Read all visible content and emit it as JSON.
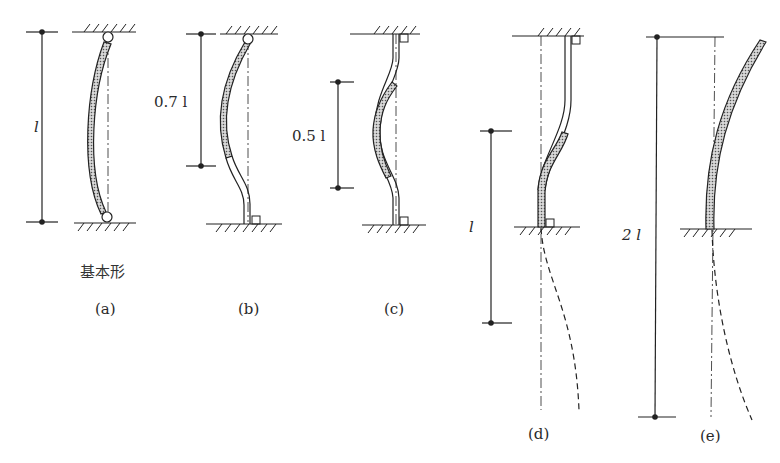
{
  "figure": {
    "panels": [
      {
        "id": "a",
        "caption": "(a)",
        "note": "基本形",
        "length_label": "l",
        "end_conditions": "pinned-pinned"
      },
      {
        "id": "b",
        "caption": "(b)",
        "length_label": "0.7 l",
        "end_conditions": "pinned-fixed"
      },
      {
        "id": "c",
        "caption": "(c)",
        "length_label": "0.5 l",
        "end_conditions": "fixed-fixed"
      },
      {
        "id": "d",
        "caption": "(d)",
        "length_label": "l",
        "end_conditions": "fixed-fixed with sway"
      },
      {
        "id": "e",
        "caption": "(e)",
        "length_label": "2 l",
        "end_conditions": "fixed-free"
      }
    ]
  },
  "colors": {
    "line": "#222222",
    "hatch_fill": "#9a9a9a"
  }
}
